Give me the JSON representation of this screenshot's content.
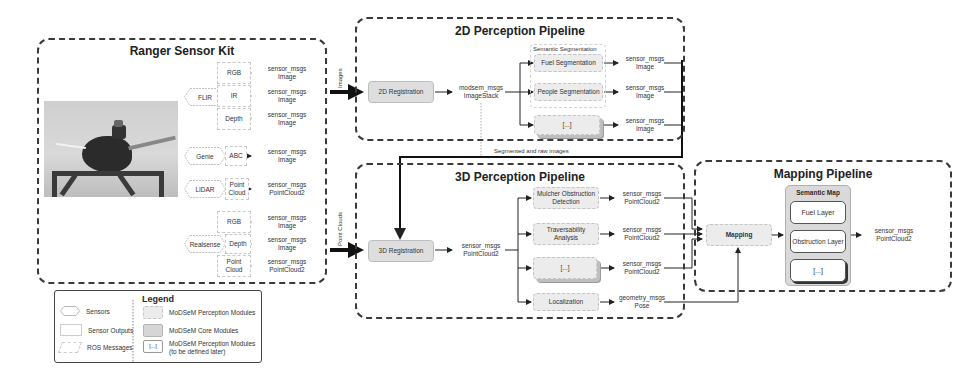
{
  "sensor_kit": {
    "title": "Ranger Sensor Kit",
    "photo_alt": "robot-with-sensor-kit-photo",
    "sensors": [
      {
        "name": "FLIR",
        "outputs": [
          {
            "label": "RGB",
            "message": "sensor_msgs\nImage"
          },
          {
            "label": "IR",
            "message": "sensor_msgs\nImage"
          },
          {
            "label": "Depth",
            "message": "sensor_msgs\nImage"
          }
        ]
      },
      {
        "name": "Genie",
        "outputs": [
          {
            "label": "ABC",
            "message": "sensor_msgs\nImage"
          }
        ]
      },
      {
        "name": "LIDAR",
        "outputs": [
          {
            "label": "Point\nCloud",
            "message": "sensor_msgs\nPointCloud2"
          }
        ]
      },
      {
        "name": "Realsense",
        "outputs": [
          {
            "label": "RGB",
            "message": "sensor_msgs\nImage"
          },
          {
            "label": "Depth",
            "message": "sensor_msgs\nImage"
          },
          {
            "label": "Point\nCloud",
            "message": "sensor_msgs\nPointCloud2"
          }
        ]
      }
    ]
  },
  "connections": {
    "images_label": "Images",
    "point_clouds_label": "Point Clouds",
    "segmented_label": "Segmented and raw images"
  },
  "pipeline_2d": {
    "title": "2D Perception Pipeline",
    "registration": "2D Registration",
    "stack_message": "modsem_msgs\nImageStack",
    "segmentation_group": "Semantic Segmentation",
    "modules": [
      {
        "label": "Fuel Segmentation",
        "message": "sensor_msgs\nImage"
      },
      {
        "label": "People Segmentation",
        "message": "sensor_msgs\nImage"
      },
      {
        "label": "[...]",
        "message": "sensor_msgs\nImage"
      }
    ]
  },
  "pipeline_3d": {
    "title": "3D Perception Pipeline",
    "registration": "3D Registration",
    "cloud_message": "sensor_msgs\nPointCloud2",
    "modules": [
      {
        "label": "Mulcher Obstruction\nDetection",
        "message": "sensor_msgs\nPointCloud2"
      },
      {
        "label": "Traversability\nAnalysis",
        "message": "sensor_msgs\nPointCloud2"
      },
      {
        "label": "[...]",
        "message": "sensor_msgs\nPointCloud2"
      },
      {
        "label": "Localization",
        "message": "geometry_msgs\nPose"
      }
    ]
  },
  "mapping": {
    "title": "Mapping Pipeline",
    "mapping_module": "Mapping",
    "semantic_map": {
      "title": "Semantic Map",
      "layers": [
        "Fuel Layer",
        "Obstruction Layer",
        "[...]"
      ]
    },
    "output_message": "sensor_msgs\nPointCloud2"
  },
  "legend": {
    "title": "Legend",
    "items_left": [
      "Sensors",
      "Sensor Outputs",
      "ROS Messages"
    ],
    "items_right": [
      "MoDSeM Perception Modules",
      "MoDSeM Core Modules",
      "MoDSeM Perception Modules\n(to be defined later)"
    ],
    "placeholder_glyph": "[...]"
  }
}
